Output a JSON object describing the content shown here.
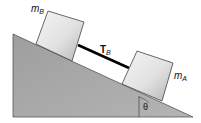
{
  "diagram": {
    "block_b_label": "m",
    "block_b_sub": "B",
    "block_a_label": "m",
    "block_a_sub": "A",
    "tension_label": "T",
    "tension_sub": "B",
    "angle_label": "θ",
    "colors": {
      "incline": "#a9a9a9",
      "block_light": "#f2f2f2",
      "block_dark": "#b8b8b8",
      "rope": "#000000",
      "outline": "#333333"
    }
  }
}
